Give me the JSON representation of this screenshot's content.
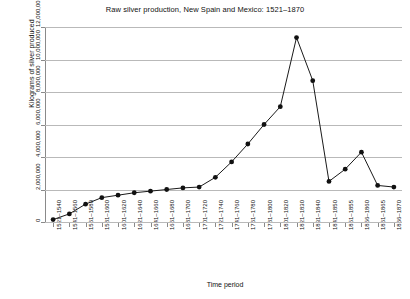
{
  "chart_data": {
    "type": "line",
    "title": "Raw silver production, New Spain and Mexico: 1521–1870",
    "xlabel": "Time period",
    "ylabel": "Kilograms of silver produced",
    "ylim": [
      0,
      12000000
    ],
    "ytick_labels": [
      "0",
      "2,000,000",
      "4,000,000",
      "6,000,000",
      "8,000,000",
      "10,000,000",
      "12,000,000"
    ],
    "ytick_values": [
      0,
      2000000,
      4000000,
      6000000,
      8000000,
      10000000,
      12000000
    ],
    "grid": true,
    "legend": "none",
    "categories": [
      "1521–1540",
      "1541–1560",
      "1561–1580",
      "1581–1600",
      "1601–1620",
      "1621–1640",
      "1641–1660",
      "1661–1680",
      "1681–1700",
      "1701–1720",
      "1721–1740",
      "1741–1760",
      "1761–1780",
      "1781–1800",
      "1801–1820",
      "1821–1830",
      "1831–1840",
      "1841–1850",
      "1851–1855",
      "1856–1860",
      "1861–1865",
      "1866–1870"
    ],
    "values": [
      150000,
      500000,
      1100000,
      1500000,
      1650000,
      1800000,
      1900000,
      2000000,
      2100000,
      2150000,
      2750000,
      3700000,
      4800000,
      6000000,
      7100000,
      11350000,
      8700000,
      2500000,
      3250000,
      4300000,
      2250000,
      2150000
    ],
    "point_values_note": "estimated from gridlines"
  }
}
